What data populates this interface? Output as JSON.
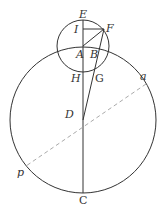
{
  "diagram": {
    "labels": {
      "E": "E",
      "I": "I",
      "F": "F",
      "A": "A",
      "B": "B",
      "H": "H",
      "G": "G",
      "D": "D",
      "a": "a",
      "p": "p",
      "C": "C"
    },
    "colors": {
      "stroke": "#333333",
      "dashed": "#aaaaaa"
    }
  }
}
